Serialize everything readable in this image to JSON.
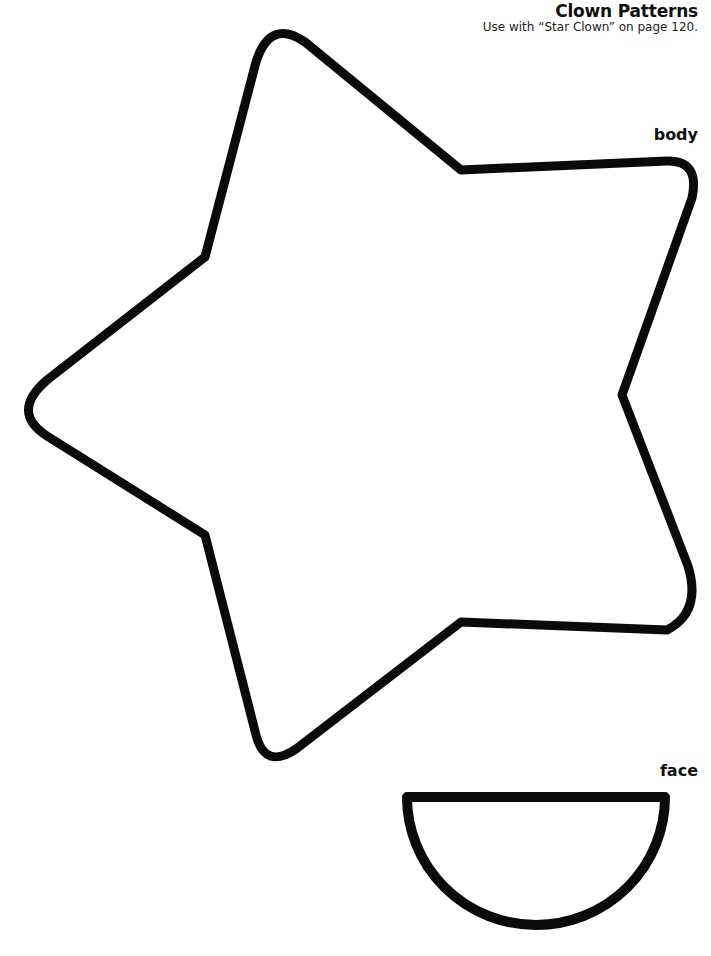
{
  "header": {
    "title": "Clown Patterns",
    "subtitle": "Use with “Star Clown” on page 120."
  },
  "patterns": [
    {
      "name": "star-body",
      "label": "body"
    },
    {
      "name": "semicircle-face",
      "label": "face"
    }
  ],
  "colors": {
    "outline": "#0a0a0a",
    "background": "#ffffff"
  }
}
